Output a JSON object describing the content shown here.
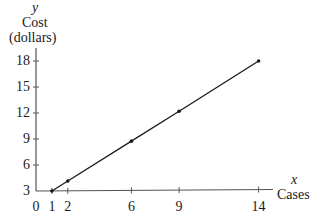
{
  "chart_data": {
    "type": "line",
    "title": "",
    "xlabel": "Cases",
    "ylabel": "Cost (dollars)",
    "x_var": "x",
    "y_var": "y",
    "x_ticks": [
      0,
      1,
      2,
      6,
      9,
      14
    ],
    "y_ticks": [
      3,
      6,
      9,
      12,
      15,
      18
    ],
    "xlim": [
      0,
      15
    ],
    "ylim": [
      3,
      20
    ],
    "grid": false,
    "legend": null,
    "series": [
      {
        "name": "Cost",
        "x": [
          1,
          2,
          6,
          9,
          14
        ],
        "values": [
          3,
          4.15,
          8.75,
          12.2,
          18
        ]
      }
    ],
    "color": "#1a1a1a"
  },
  "labels": {
    "y_var": "y",
    "y_title_line1": "Cost",
    "y_title_line2": "(dollars)",
    "x_var": "x",
    "x_title": "Cases"
  }
}
